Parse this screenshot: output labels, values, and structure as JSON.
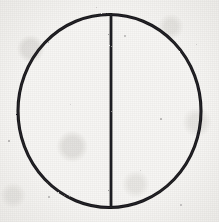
{
  "figure": {
    "medium": "ink on paper scan",
    "canvas": {
      "width": 219,
      "height": 222
    },
    "colors": {
      "paper": "#f7f6f4",
      "paper_shadow": "#e8e6e2",
      "ink": "#19171a",
      "ink_light": "#3a3739"
    },
    "shapes": [
      {
        "name": "circle-outline",
        "type": "ellipse",
        "center_x": 109.5,
        "center_y": 111,
        "radius_x": 91.5,
        "radius_y": 96.5,
        "stroke_width": 3.1,
        "fill": "none"
      },
      {
        "name": "vertical-diameter-line",
        "type": "line",
        "x1": 111,
        "y1": 14.5,
        "x2": 111,
        "y2": 207.5,
        "stroke_width": 2.8
      }
    ],
    "bounds": {
      "left": 18,
      "right": 201,
      "top": 14,
      "bottom": 208
    },
    "specks": [
      {
        "x": 8,
        "y": 140,
        "size": 2.0,
        "opacity": 0.4
      },
      {
        "x": 48,
        "y": 196,
        "size": 1.6,
        "opacity": 0.32
      },
      {
        "x": 124,
        "y": 35,
        "size": 1.5,
        "opacity": 0.3
      },
      {
        "x": 160,
        "y": 118,
        "size": 1.7,
        "opacity": 0.34
      },
      {
        "x": 96,
        "y": 7,
        "size": 1.4,
        "opacity": 0.26
      },
      {
        "x": 180,
        "y": 204,
        "size": 1.5,
        "opacity": 0.28
      },
      {
        "x": 70,
        "y": 104,
        "size": 1.3,
        "opacity": 0.22
      },
      {
        "x": 196,
        "y": 44,
        "size": 1.4,
        "opacity": 0.24
      },
      {
        "x": 30,
        "y": 62,
        "size": 1.3,
        "opacity": 0.22
      },
      {
        "x": 140,
        "y": 170,
        "size": 1.4,
        "opacity": 0.25
      }
    ]
  }
}
